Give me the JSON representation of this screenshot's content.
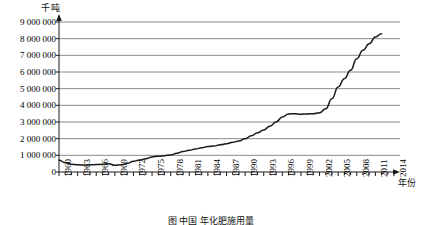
{
  "chart_data": {
    "type": "line",
    "title": "",
    "unit_label": "千吨",
    "xlabel": "年份",
    "ylabel": "",
    "ylim": [
      0,
      9000000
    ],
    "xlim": [
      1960,
      2014
    ],
    "grid": "horizontal",
    "legend": "none",
    "y_ticks": [
      0,
      1000000,
      2000000,
      3000000,
      4000000,
      5000000,
      6000000,
      7000000,
      8000000,
      9000000
    ],
    "y_tick_labels": [
      "0",
      "1 000 000",
      "2 000 000",
      "3 000 000",
      "4 000 000",
      "5 000 000",
      "6 000 000",
      "7 000 000",
      "8 000 000",
      "9 000 000"
    ],
    "x_tick_labels": [
      "1960",
      "1963",
      "1966",
      "1969",
      "1972",
      "1975",
      "1978",
      "1981",
      "1984",
      "1987",
      "1990",
      "1993",
      "1996",
      "1999",
      "2002",
      "2005",
      "2008",
      "2011",
      "2014"
    ],
    "x_tick_step_years": 3,
    "minor_ticks_every_year": true,
    "series": [
      {
        "name": "化肥施用量",
        "color": "#1a1a1a",
        "x": [
          1960,
          1961,
          1962,
          1963,
          1964,
          1965,
          1966,
          1967,
          1968,
          1969,
          1970,
          1971,
          1972,
          1973,
          1974,
          1975,
          1976,
          1977,
          1978,
          1979,
          1980,
          1981,
          1982,
          1983,
          1984,
          1985,
          1986,
          1987,
          1988,
          1989,
          1990,
          1991,
          1992,
          1993,
          1994,
          1995,
          1996,
          1997,
          1998,
          1999,
          2000,
          2001,
          2002,
          2003,
          2004,
          2005,
          2006,
          2007,
          2008,
          2009,
          2010,
          2011,
          2012
        ],
        "values": [
          700000,
          560000,
          470000,
          430000,
          420000,
          430000,
          450000,
          460000,
          500000,
          400000,
          430000,
          520000,
          640000,
          720000,
          800000,
          900000,
          950000,
          980000,
          1020000,
          1120000,
          1230000,
          1300000,
          1380000,
          1450000,
          1530000,
          1560000,
          1640000,
          1700000,
          1780000,
          1860000,
          2000000,
          2180000,
          2350000,
          2520000,
          2750000,
          3000000,
          3300000,
          3480000,
          3500000,
          3470000,
          3480000,
          3500000,
          3560000,
          3800000,
          4400000,
          5100000,
          5600000,
          6100000,
          6800000,
          7300000,
          7700000,
          8100000,
          8300000
        ]
      }
    ]
  },
  "caption": "图  中国  年化肥施用量"
}
